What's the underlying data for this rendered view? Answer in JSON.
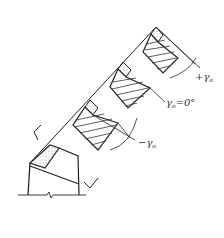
{
  "diagram": {
    "type": "cutting-tool-rake-angle-sections",
    "colors": {
      "line": "#222222",
      "hatch": "#333333",
      "background": "#ffffff"
    },
    "labels": {
      "positive_rake": {
        "sign": "+",
        "symbol": "γ",
        "subscript": "o",
        "text": "+γo"
      },
      "zero_rake": {
        "symbol": "γ",
        "subscript": "o",
        "suffix": "=0°",
        "text": "γo=0°"
      },
      "negative_rake": {
        "sign": "−",
        "symbol": "γ",
        "subscript": "o",
        "text": "−γo"
      }
    },
    "sections": [
      {
        "name": "positive-rake-section",
        "label": "+γo"
      },
      {
        "name": "zero-rake-section",
        "label": "γo=0°"
      },
      {
        "name": "negative-rake-section",
        "label": "−γo"
      }
    ]
  }
}
